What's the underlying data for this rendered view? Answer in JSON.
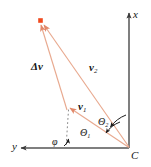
{
  "figure": {
    "background_color": "#ffffff",
    "axis_color": "#4d4d4d",
    "vector_color": "#e8a98f",
    "marker_color": "#f04a1e",
    "text_color": "#151515",
    "width": 151,
    "height": 167
  },
  "axes": {
    "origin_label": "C",
    "x_axis": {
      "label": "x",
      "direction": "up",
      "arrow": true
    },
    "y_axis": {
      "label": "y",
      "direction": "left",
      "arrow": true
    }
  },
  "vectors": [
    {
      "name": "v1",
      "label": "v",
      "subscript": "1",
      "from": "C",
      "to": "tip1"
    },
    {
      "name": "v2",
      "label": "v",
      "subscript": "2",
      "from": "C",
      "to": "tip2"
    },
    {
      "name": "delta_v",
      "label": "Δv",
      "subscript": "",
      "from": "tip1",
      "to": "tip2"
    }
  ],
  "angles": [
    {
      "name": "theta1",
      "label": "Θ",
      "subscript": "1",
      "between": "x-axis and v1"
    },
    {
      "name": "theta2",
      "label": "Θ",
      "subscript": "2",
      "between": "x-axis and v2"
    },
    {
      "name": "phi",
      "label": "φ",
      "subscript": "",
      "between": "y-axis and delta_v"
    }
  ],
  "labels": {
    "x": "x",
    "y": "y",
    "C": "C",
    "delta_v": "Δv",
    "v_base": "v",
    "sub_1": "1",
    "sub_2": "2",
    "theta": "Θ",
    "phi": "φ"
  }
}
